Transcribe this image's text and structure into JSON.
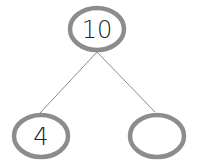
{
  "diagram": {
    "type": "number-bond",
    "whole": {
      "value": "10",
      "cx": 97,
      "cy": 29
    },
    "parts": [
      {
        "value": "4",
        "cx": 41,
        "cy": 136
      },
      {
        "value": "",
        "cx": 157,
        "cy": 136
      }
    ],
    "colors": {
      "circle_stroke": "#8c8c8c",
      "line": "#8a8a8a",
      "text": "#222222"
    }
  }
}
